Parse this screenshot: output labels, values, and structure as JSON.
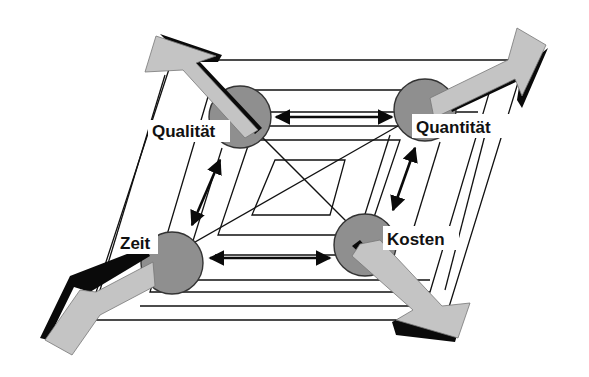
{
  "diagram": {
    "type": "magic-quadrilateral",
    "corners": {
      "top_left": "Qualität",
      "top_right": "Quantität",
      "bottom_left": "Zeit",
      "bottom_right": "Kosten"
    },
    "colors": {
      "node_fill": "#8f8f8f",
      "arrow_fill": "#c4c4c4",
      "shadow": "#0a0a0a",
      "line": "#111111",
      "background": "#ffffff"
    },
    "relations": [
      {
        "from": "Qualität",
        "to": "Quantität",
        "kind": "double-arrow"
      },
      {
        "from": "Qualität",
        "to": "Zeit",
        "kind": "double-arrow"
      },
      {
        "from": "Zeit",
        "to": "Kosten",
        "kind": "double-arrow"
      },
      {
        "from": "Quantität",
        "to": "Kosten",
        "kind": "double-arrow"
      }
    ]
  }
}
